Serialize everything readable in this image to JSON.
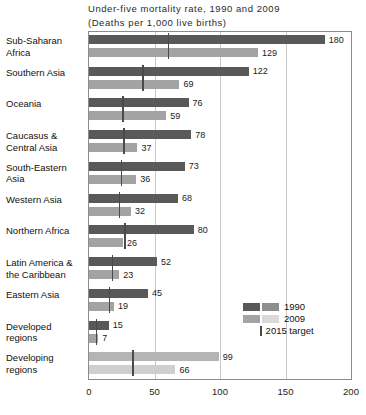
{
  "chart_data": {
    "type": "bar",
    "orientation": "horizontal",
    "title": "Under-five mortality rate, 1990 and 2009",
    "subtitle": "(Deaths per 1,000 live births)",
    "xlabel": "",
    "ylabel": "",
    "xlim": [
      0,
      200
    ],
    "xticks": [
      0,
      50,
      100,
      150,
      200
    ],
    "xtick_labels": [
      "0",
      "50",
      "100",
      "150",
      "200"
    ],
    "grid": true,
    "legend_position": "inside-right",
    "categories": [
      "Sub-Saharan Africa",
      "Southern Asia",
      "Oceania",
      "Caucasus & Central Asia",
      "South-Eastern Asia",
      "Western Asia",
      "Northern Africa",
      "Latin America & the Caribbean",
      "Eastern Asia",
      "Developed regions",
      "Developing regions"
    ],
    "series": [
      {
        "name": "1990",
        "color": "#595959",
        "values": [
          180,
          122,
          76,
          78,
          73,
          68,
          80,
          52,
          45,
          15,
          99
        ]
      },
      {
        "name": "2009",
        "color": "#a3a3a3",
        "values": [
          129,
          69,
          59,
          37,
          36,
          32,
          26,
          23,
          19,
          7,
          66
        ]
      }
    ],
    "target_marker": {
      "name": "2015 target",
      "color": "#4a4a4a",
      "values": [
        60,
        40.7,
        25.3,
        26,
        24.3,
        22.7,
        26.7,
        17.3,
        15,
        5,
        33
      ]
    },
    "legend_entries": [
      {
        "label": "1990",
        "type": "swatch-pair",
        "colors": [
          "#595959",
          "#8f8f8f"
        ]
      },
      {
        "label": "2009",
        "type": "swatch-pair",
        "colors": [
          "#a3a3a3",
          "#d9d9d9"
        ]
      },
      {
        "label": "2015 target",
        "type": "tick",
        "colors": [
          "#4a4a4a"
        ]
      }
    ]
  },
  "rows": [
    {
      "label_line1": "Sub-Saharan",
      "label_line2": "Africa",
      "v1990": "180",
      "v2009": "129",
      "muted": false
    },
    {
      "label_line1": "Southern Asia",
      "label_line2": "",
      "v1990": "122",
      "v2009": "69",
      "muted": false
    },
    {
      "label_line1": "Oceania",
      "label_line2": "",
      "v1990": "76",
      "v2009": "59",
      "muted": false
    },
    {
      "label_line1": "Caucasus &",
      "label_line2": "Central Asia",
      "v1990": "78",
      "v2009": "37",
      "muted": false
    },
    {
      "label_line1": "South-Eastern",
      "label_line2": "Asia",
      "v1990": "73",
      "v2009": "36",
      "muted": false
    },
    {
      "label_line1": "Western Asia",
      "label_line2": "",
      "v1990": "68",
      "v2009": "32",
      "muted": false
    },
    {
      "label_line1": "Northern Africa",
      "label_line2": "",
      "v1990": "80",
      "v2009": "26",
      "muted": false
    },
    {
      "label_line1": "Latin America &",
      "label_line2": "the Caribbean",
      "v1990": "52",
      "v2009": "23",
      "muted": false
    },
    {
      "label_line1": "Eastern Asia",
      "label_line2": "",
      "v1990": "45",
      "v2009": "19",
      "muted": false
    },
    {
      "label_line1": "Developed",
      "label_line2": "regions",
      "v1990": "15",
      "v2009": "7",
      "muted": false
    },
    {
      "label_line1": "Developing",
      "label_line2": "regions",
      "v1990": "99",
      "v2009": "66",
      "muted": true
    }
  ]
}
